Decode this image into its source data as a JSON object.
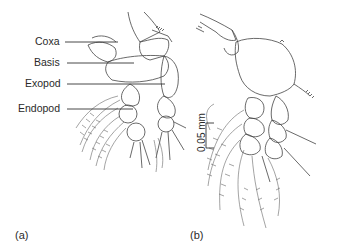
{
  "figure": {
    "panel_a": {
      "label": "(a)",
      "annotations": [
        {
          "text": "Coxa"
        },
        {
          "text": "Basis"
        },
        {
          "text": "Exopod"
        },
        {
          "text": "Endopod"
        }
      ]
    },
    "panel_b": {
      "label": "(b)",
      "scale_bar": "0.05 mm"
    },
    "colors": {
      "ink": "#2a2a2a",
      "background": "#ffffff"
    }
  }
}
